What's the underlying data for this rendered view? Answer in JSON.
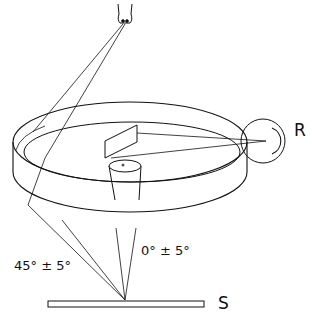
{
  "diagram": {
    "type": "optical-geometry-schematic",
    "components": [
      {
        "id": "lamp",
        "role": "light source",
        "position": "top"
      },
      {
        "id": "ring-reflector",
        "role": "annular ellipsoidal illumination ring"
      },
      {
        "id": "mirror",
        "role": "plane mirror inside ring"
      },
      {
        "id": "lens-cone",
        "role": "viewing optics / cone"
      },
      {
        "id": "receiver",
        "role": "detector"
      },
      {
        "id": "sample",
        "role": "specimen surface"
      }
    ],
    "labels": {
      "receiver": "R",
      "sample": "S",
      "illumination_angle": "45° ± 5°",
      "viewing_angle": "0° ± 5°"
    },
    "colors": {
      "line": "#111111",
      "background": "#ffffff"
    }
  }
}
